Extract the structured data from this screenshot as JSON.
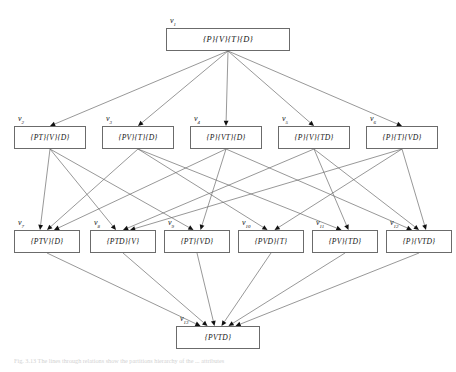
{
  "figure": {
    "caption": "Fig. 3.13  The lines through relations show the partitions hierarchy of the ... attributes",
    "edge_color": "#6b6b6b",
    "box_border_color": "#6b6b6b",
    "text_color": "#141414"
  },
  "nodes": [
    {
      "id": "v1",
      "label": "v",
      "sub": "1",
      "text": "{P}{V}{T}{D}",
      "x": 166,
      "y": 28,
      "w": 124,
      "h": 23,
      "fs": 8.4
    },
    {
      "id": "v2",
      "label": "v",
      "sub": "2",
      "text": "{PT}{V}{D}",
      "x": 14,
      "y": 126,
      "w": 72,
      "h": 23,
      "fs": 7.6
    },
    {
      "id": "v3",
      "label": "v",
      "sub": "3",
      "text": "{PV}{T}{D}",
      "x": 102,
      "y": 126,
      "w": 72,
      "h": 23,
      "fs": 7.6
    },
    {
      "id": "v4",
      "label": "v",
      "sub": "4",
      "text": "{P}{VT}{D}",
      "x": 190,
      "y": 126,
      "w": 72,
      "h": 23,
      "fs": 7.6
    },
    {
      "id": "v5",
      "label": "v",
      "sub": "5",
      "text": "{P}{V}{TD}",
      "x": 278,
      "y": 126,
      "w": 72,
      "h": 23,
      "fs": 7.6
    },
    {
      "id": "v6",
      "label": "v",
      "sub": "6",
      "text": "{P}{T}{VD}",
      "x": 366,
      "y": 126,
      "w": 72,
      "h": 23,
      "fs": 7.6
    },
    {
      "id": "v7",
      "label": "v",
      "sub": "7",
      "text": "{PTV}{D}",
      "x": 14,
      "y": 230,
      "w": 66,
      "h": 23,
      "fs": 7.6
    },
    {
      "id": "v8",
      "label": "v",
      "sub": "8",
      "text": "{PTD}{V}",
      "x": 90,
      "y": 230,
      "w": 66,
      "h": 23,
      "fs": 7.6
    },
    {
      "id": "v9",
      "label": "v",
      "sub": "9",
      "text": "{PT}{VD}",
      "x": 164,
      "y": 230,
      "w": 66,
      "h": 23,
      "fs": 7.6
    },
    {
      "id": "v10",
      "label": "v",
      "sub": "10",
      "text": "{PVD}{T}",
      "x": 238,
      "y": 230,
      "w": 66,
      "h": 23,
      "fs": 7.6
    },
    {
      "id": "v11",
      "label": "v",
      "sub": "11",
      "text": "{PV}{TD}",
      "x": 312,
      "y": 230,
      "w": 66,
      "h": 23,
      "fs": 7.6
    },
    {
      "id": "v12",
      "label": "v",
      "sub": "12",
      "text": "{P}{VTD}",
      "x": 386,
      "y": 230,
      "w": 66,
      "h": 23,
      "fs": 7.6
    },
    {
      "id": "v13",
      "label": "v",
      "sub": "13",
      "text": "{PVTD}",
      "x": 176,
      "y": 326,
      "w": 84,
      "h": 23,
      "fs": 7.6
    }
  ],
  "edges": [
    {
      "from": "v1",
      "to": "v2"
    },
    {
      "from": "v1",
      "to": "v3"
    },
    {
      "from": "v1",
      "to": "v4"
    },
    {
      "from": "v1",
      "to": "v5"
    },
    {
      "from": "v1",
      "to": "v6"
    },
    {
      "from": "v2",
      "to": "v7"
    },
    {
      "from": "v2",
      "to": "v8"
    },
    {
      "from": "v2",
      "to": "v9"
    },
    {
      "from": "v3",
      "to": "v7"
    },
    {
      "from": "v3",
      "to": "v10"
    },
    {
      "from": "v3",
      "to": "v11"
    },
    {
      "from": "v4",
      "to": "v7"
    },
    {
      "from": "v4",
      "to": "v9"
    },
    {
      "from": "v4",
      "to": "v12"
    },
    {
      "from": "v5",
      "to": "v8"
    },
    {
      "from": "v5",
      "to": "v11"
    },
    {
      "from": "v5",
      "to": "v12"
    },
    {
      "from": "v6",
      "to": "v8"
    },
    {
      "from": "v6",
      "to": "v10"
    },
    {
      "from": "v6",
      "to": "v12"
    },
    {
      "from": "v7",
      "to": "v13"
    },
    {
      "from": "v8",
      "to": "v13"
    },
    {
      "from": "v9",
      "to": "v13"
    },
    {
      "from": "v10",
      "to": "v13"
    },
    {
      "from": "v11",
      "to": "v13"
    },
    {
      "from": "v12",
      "to": "v13"
    }
  ]
}
